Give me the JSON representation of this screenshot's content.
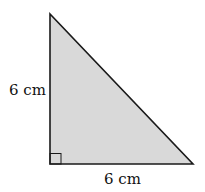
{
  "diagram": {
    "shape": "right-triangle",
    "fill_color": "#d9d9d9",
    "stroke_color": "#1a1a1a",
    "left_side_label": "6 cm",
    "bottom_side_label": "6 cm",
    "right_angle_marker": true
  }
}
